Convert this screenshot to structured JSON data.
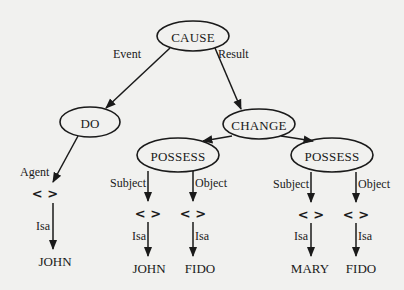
{
  "diagram": {
    "background": "#f1f1ef",
    "ink": "#1a1a1a",
    "nodes": {
      "cause": {
        "label": "CAUSE",
        "cx": 193,
        "cy": 36,
        "rx": 36,
        "ry": 15
      },
      "do": {
        "label": "DO",
        "cx": 90,
        "cy": 122,
        "rx": 30,
        "ry": 15
      },
      "change": {
        "label": "CHANGE",
        "cx": 259,
        "cy": 124,
        "rx": 36,
        "ry": 15
      },
      "possess_left": {
        "label": "POSSESS",
        "cx": 178,
        "cy": 155,
        "rx": 41,
        "ry": 17
      },
      "possess_right": {
        "label": "POSSESS",
        "cx": 332,
        "cy": 155,
        "rx": 41,
        "ry": 17
      }
    },
    "placeholders": {
      "agent": {
        "label": "< >",
        "x": 45,
        "y": 193
      },
      "pl_subject": {
        "label": "< >",
        "x": 148,
        "y": 213
      },
      "pl_object": {
        "label": "< >",
        "x": 193,
        "y": 213
      },
      "pr_subject": {
        "label": "< >",
        "x": 311,
        "y": 214
      },
      "pr_object": {
        "label": "< >",
        "x": 356,
        "y": 214
      }
    },
    "leaves": {
      "agent_john": {
        "label": "JOHN",
        "x": 55,
        "y": 261
      },
      "pl_john": {
        "label": "JOHN",
        "x": 149,
        "y": 268
      },
      "pl_fido": {
        "label": "FIDO",
        "x": 200,
        "y": 268
      },
      "pr_mary": {
        "label": "MARY",
        "x": 310,
        "y": 268
      },
      "pr_fido": {
        "label": "FIDO",
        "x": 361,
        "y": 268
      }
    },
    "edge_labels": {
      "event": "Event",
      "result": "Result",
      "agent": "Agent",
      "agent_isa": "Isa",
      "pl_subject": "Subject",
      "pl_object": "Object",
      "pl_subject_isa": "Isa",
      "pl_object_isa": "Isa",
      "pr_subject": "Subject",
      "pr_object": "Object",
      "pr_subject_isa": "Isa",
      "pr_object_isa": "Isa"
    }
  }
}
